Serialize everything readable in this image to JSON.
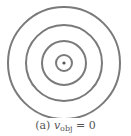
{
  "figure": {
    "caption": {
      "label": "(a)",
      "variable": "v",
      "subscript": "obj",
      "relation": "= 0"
    },
    "center": [
      64,
      63
    ],
    "ring_radii": [
      56,
      38,
      22,
      8
    ],
    "stroke_color": "#7a7a7a",
    "dot_color": "#555555"
  }
}
